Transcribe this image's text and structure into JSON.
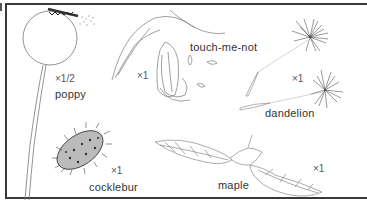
{
  "figure": {
    "specimens": [
      {
        "id": "poppy",
        "name": "poppy",
        "scale": "×1/2"
      },
      {
        "id": "touch-me-not",
        "name": "touch-me-not",
        "scale": "×1"
      },
      {
        "id": "dandelion",
        "name": "dandelion",
        "scale": "×1"
      },
      {
        "id": "cocklebur",
        "name": "cocklebur",
        "scale": "×1"
      },
      {
        "id": "maple",
        "name": "maple",
        "scale": "×1"
      }
    ]
  }
}
